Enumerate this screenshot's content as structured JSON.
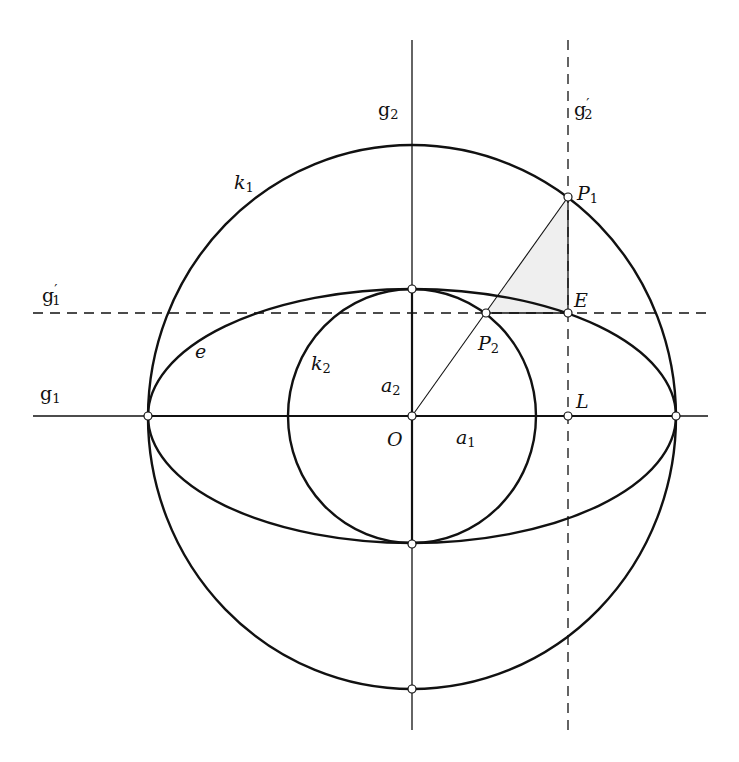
{
  "diagram": {
    "colors": {
      "stroke": "#111111",
      "triangle_fill": "#efefef",
      "point_fill": "#ffffff"
    },
    "geometry": {
      "center_O": [
        412,
        416
      ],
      "k1": {
        "rx": 264,
        "ry": 272
      },
      "k2": {
        "rx": 124,
        "ry": 127
      },
      "ellipse_e": {
        "rx": 264,
        "ry": 127
      },
      "P1": [
        568,
        197
      ],
      "P2": [
        486,
        313
      ],
      "E": [
        568,
        313
      ],
      "L": [
        568,
        416
      ]
    },
    "labels": {
      "g1": {
        "base": "g",
        "sub": "1",
        "prime": ""
      },
      "g1_prime": {
        "base": "g",
        "sub": "1",
        "prime": "′"
      },
      "g2": {
        "base": "g",
        "sub": "2",
        "prime": ""
      },
      "g2_prime": {
        "base": "g",
        "sub": "2",
        "prime": "′"
      },
      "k1": {
        "base": "k",
        "sub": "1"
      },
      "k2": {
        "base": "k",
        "sub": "2"
      },
      "e": "e",
      "a1": {
        "base": "a",
        "sub": "1"
      },
      "a2": {
        "base": "a",
        "sub": "2"
      },
      "O": "O",
      "L": "L",
      "E": "E",
      "P1": {
        "base": "P",
        "sub": "1"
      },
      "P2": {
        "base": "P",
        "sub": "2"
      }
    }
  }
}
